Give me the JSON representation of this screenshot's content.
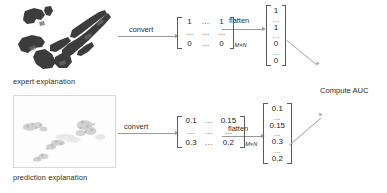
{
  "diagram": {
    "panels": {
      "expert": {
        "caption": "expert explanation",
        "image_name": "expert-explanation-mask"
      },
      "prediction": {
        "caption": "prediction explanation",
        "image_name": "prediction-explanation-heatmap"
      }
    },
    "arrows": {
      "convert_top": "convert",
      "flatten_top": "flatten",
      "convert_bottom": "convert",
      "flatten_bottom": "flatten"
    },
    "matrices": {
      "expert": {
        "rows": [
          [
            "1",
            "…",
            "1"
          ],
          [
            "…",
            "…",
            "…"
          ],
          [
            "0",
            "…",
            "0"
          ]
        ],
        "subscript": "M×N"
      },
      "prediction": {
        "rows": [
          [
            "0.1",
            "…",
            "0.15"
          ],
          [
            "…",
            "…",
            "…"
          ],
          [
            "0.3",
            "…",
            "0.2"
          ]
        ],
        "subscript": "M×N"
      }
    },
    "vectors": {
      "expert": [
        "1",
        "…",
        "1",
        "…",
        "0",
        "…",
        "0"
      ],
      "prediction": [
        "0.1",
        "…",
        "0.15",
        "…",
        "0.3",
        "…",
        "0.2"
      ]
    },
    "output": {
      "label": "Compute AUC"
    },
    "colors": {
      "line": "#9a9a9a",
      "diagonal_line": "#b0b0b0",
      "text": "#2b2b2b",
      "bracket": "#5a5a5a",
      "mask_blob": "#3a3a3a",
      "background": "#ffffff"
    }
  }
}
